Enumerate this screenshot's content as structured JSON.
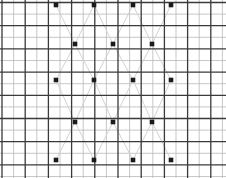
{
  "figure": {
    "name": "grid-lattice-dot-diagram",
    "width": 226,
    "height": 178,
    "background_color": "#ffffff"
  },
  "grid": {
    "minor_spacing": 11.6,
    "minor_color": "#b9b9b9",
    "minor_width": 0.8,
    "major_every": 2,
    "major_color": "#3a3a3a",
    "major_width": 1.3,
    "x_origin": 2.0,
    "y_origin": 2.5,
    "n_vertical": 20,
    "n_horizontal": 16
  },
  "diagonals": {
    "color": "#d2d2d2",
    "width": 1.0,
    "segments": [
      [
        56,
        5,
        75,
        44
      ],
      [
        75,
        44,
        94,
        5
      ],
      [
        94,
        5,
        113,
        44
      ],
      [
        113,
        44,
        133,
        5
      ],
      [
        133,
        5,
        152,
        44
      ],
      [
        152,
        44,
        171,
        5
      ],
      [
        56,
        80,
        75,
        44
      ],
      [
        75,
        44,
        94,
        80
      ],
      [
        94,
        80,
        113,
        44
      ],
      [
        113,
        44,
        133,
        80
      ],
      [
        133,
        80,
        152,
        44
      ],
      [
        152,
        44,
        171,
        80
      ],
      [
        56,
        80,
        75,
        122
      ],
      [
        75,
        122,
        94,
        80
      ],
      [
        94,
        80,
        113,
        122
      ],
      [
        113,
        122,
        133,
        80
      ],
      [
        133,
        80,
        152,
        122
      ],
      [
        152,
        122,
        171,
        80
      ],
      [
        56,
        160,
        75,
        122
      ],
      [
        75,
        122,
        94,
        160
      ],
      [
        94,
        160,
        113,
        122
      ],
      [
        113,
        122,
        133,
        160
      ],
      [
        133,
        160,
        152,
        122
      ],
      [
        152,
        122,
        171,
        160
      ]
    ]
  },
  "points": {
    "color": "#1a1a1a",
    "size": 4.6,
    "shape": "square",
    "rows": [
      {
        "label": "row-1",
        "y": 5,
        "x": [
          56,
          94,
          133,
          171
        ]
      },
      {
        "label": "row-2",
        "y": 44,
        "x": [
          75,
          113,
          152
        ]
      },
      {
        "label": "row-3",
        "y": 80,
        "x": [
          56,
          94,
          133,
          171
        ]
      },
      {
        "label": "row-4",
        "y": 122,
        "x": [
          75,
          113,
          152
        ]
      },
      {
        "label": "row-5",
        "y": 160,
        "x": [
          56,
          94,
          133,
          171
        ]
      }
    ],
    "total_count": 18
  }
}
